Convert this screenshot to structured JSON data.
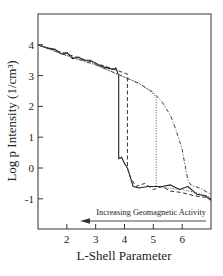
{
  "chart_data": {
    "type": "line",
    "title": "",
    "xlabel": "L-Shell Parameter",
    "ylabel": "Log p Intensity (1/cm³)",
    "xlim": [
      1,
      7
    ],
    "ylim": [
      -1.9,
      4.9
    ],
    "xticks": [
      2,
      3,
      4,
      5,
      6
    ],
    "yticks": [
      4,
      3,
      2,
      1,
      0,
      -1
    ],
    "grid": false,
    "legend": null,
    "annotations": [
      {
        "text": "Increasing Geomagnetic Activity",
        "arrow": "left",
        "x_from": 6.8,
        "x_to": 2.6
      }
    ],
    "series": [
      {
        "name": "solid",
        "style": "solid",
        "x": [
          1.0,
          1.3,
          1.6,
          1.8,
          2.0,
          2.2,
          2.4,
          2.6,
          2.8,
          3.0,
          3.2,
          3.4,
          3.6,
          3.7,
          3.8,
          3.8,
          3.9,
          4.0,
          4.1,
          4.2,
          4.3,
          4.5,
          4.8,
          5.0,
          5.3,
          5.6,
          5.9,
          6.2,
          6.5,
          6.8,
          7.0
        ],
        "y": [
          4.0,
          3.9,
          3.85,
          3.7,
          3.75,
          3.55,
          3.6,
          3.5,
          3.5,
          3.4,
          3.3,
          3.25,
          3.2,
          3.25,
          3.0,
          0.3,
          0.35,
          0.15,
          0.0,
          -0.3,
          -0.6,
          -0.65,
          -0.6,
          -0.6,
          -0.6,
          -0.55,
          -0.7,
          -0.6,
          -0.85,
          -0.9,
          -1.05
        ]
      },
      {
        "name": "dashed",
        "style": "dashed",
        "x": [
          1.0,
          1.5,
          2.0,
          2.5,
          3.0,
          3.5,
          3.8,
          4.1,
          4.1,
          4.2,
          4.4,
          4.7,
          5.0,
          5.3,
          5.6,
          6.0,
          6.4,
          6.8,
          7.0
        ],
        "y": [
          4.0,
          3.85,
          3.7,
          3.55,
          3.4,
          3.25,
          3.15,
          3.05,
          0.0,
          -0.3,
          -0.6,
          -0.5,
          -0.7,
          -0.6,
          -0.75,
          -0.8,
          -0.9,
          -0.95,
          -1.0
        ]
      },
      {
        "name": "dotted",
        "style": "dotted",
        "x": [
          1.0,
          2.0,
          3.0,
          4.0,
          4.5,
          4.9,
          5.1,
          5.1,
          5.5,
          6.0,
          6.5,
          7.0
        ],
        "y": [
          4.0,
          3.65,
          3.35,
          2.95,
          2.75,
          2.5,
          2.3,
          -0.6,
          -0.65,
          -0.7,
          -0.8,
          -0.95
        ]
      },
      {
        "name": "dash-dot",
        "style": "dashdot",
        "x": [
          1.0,
          2.0,
          3.0,
          4.0,
          4.5,
          5.0,
          5.3,
          5.6,
          5.8,
          6.0,
          6.1,
          6.2,
          6.3,
          6.6,
          7.0
        ],
        "y": [
          4.0,
          3.65,
          3.35,
          2.95,
          2.75,
          2.45,
          2.15,
          1.7,
          1.2,
          0.6,
          0.1,
          -0.4,
          -0.55,
          -0.65,
          -0.85
        ]
      }
    ]
  }
}
